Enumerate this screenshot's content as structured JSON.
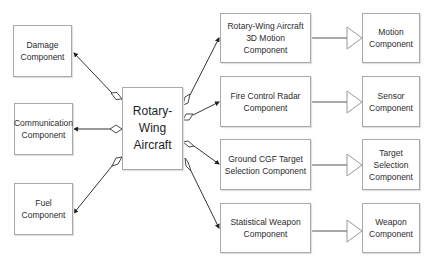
{
  "diagram": {
    "type": "uml-class-composition",
    "central": {
      "line1": "Rotary-Wing",
      "line2": "Aircraft"
    },
    "left_components": [
      {
        "line1": "Damage",
        "line2": "Component"
      },
      {
        "line1": "Communication",
        "line2": "Component"
      },
      {
        "line1": "Fuel",
        "line2": "Component"
      }
    ],
    "right_components": [
      {
        "line1": "Rotary-Wing Aircraft",
        "line2": "3D Motion Component"
      },
      {
        "line1": "Fire Control Radar",
        "line2": "Component"
      },
      {
        "line1": "Ground CGF Target",
        "line2": "Selection Component"
      },
      {
        "line1": "Statistical Weapon",
        "line2": "Component"
      }
    ],
    "base_components": [
      {
        "line1": "Motion",
        "line2": "Component"
      },
      {
        "line1": "Sensor",
        "line2": "Component"
      },
      {
        "line1": "Target Selection",
        "line2": "Component"
      },
      {
        "line1": "Weapon",
        "line2": "Component"
      }
    ],
    "relations": {
      "composition": "aggregation (hollow diamond) from Rotary-Wing Aircraft to each component",
      "inheritance": "generalization (hollow triangle) from specific component to base component"
    },
    "colors": {
      "box_border": "#a9a9a9",
      "line": "#333333",
      "text": "#2b2b2b"
    }
  }
}
